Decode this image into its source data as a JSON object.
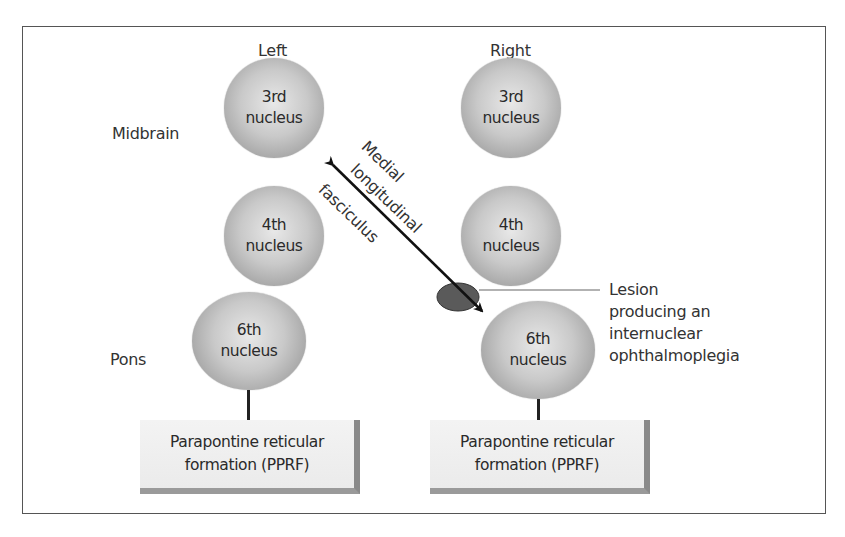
{
  "diagram": {
    "columns": {
      "left": "Left",
      "right": "Right"
    },
    "regions": {
      "midbrain": "Midbrain",
      "pons": "Pons"
    },
    "nuclei": {
      "left_3rd": {
        "line1": "3rd",
        "line2": "nucleus"
      },
      "left_4th": {
        "line1": "4th",
        "line2": "nucleus"
      },
      "left_6th": {
        "line1": "6th",
        "line2": "nucleus"
      },
      "right_3rd": {
        "line1": "3rd",
        "line2": "nucleus"
      },
      "right_4th": {
        "line1": "4th",
        "line2": "nucleus"
      },
      "right_6th": {
        "line1": "6th",
        "line2": "nucleus"
      }
    },
    "pprf": {
      "left": {
        "line1": "Parapontine reticular",
        "line2": "formation (PPRF)"
      },
      "right": {
        "line1": "Parapontine reticular",
        "line2": "formation (PPRF)"
      }
    },
    "mlf": {
      "line1": "Medial",
      "line2": "longitudinal",
      "line3": "fasciculus"
    },
    "lesion": {
      "line1": "Lesion",
      "line2": "producing an",
      "line3": "internuclear",
      "line4": "ophthalmoplegia"
    },
    "colors": {
      "nucleus_fill": "#c9c9c9",
      "lesion_fill": "#5a5a5a",
      "arrow": "#111111",
      "frame": "#555555"
    }
  }
}
